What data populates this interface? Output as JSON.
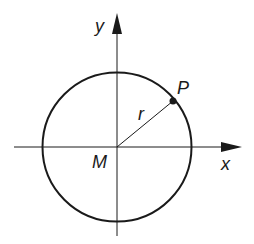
{
  "diagram": {
    "labels": {
      "y_axis": "y",
      "x_axis": "x",
      "center": "M",
      "point": "P",
      "radius": "r"
    },
    "colors": {
      "stroke": "#1a1a1a",
      "background": "#ffffff"
    }
  }
}
